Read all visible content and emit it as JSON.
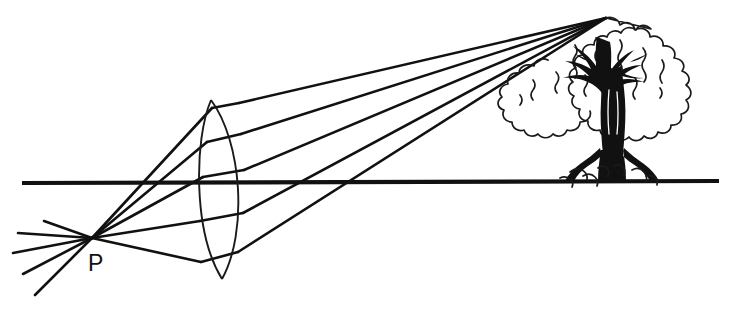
{
  "figure": {
    "background_color": "#ffffff",
    "ink_color": "#111111",
    "width": 731,
    "height": 310
  },
  "labels": {
    "point_p": "P"
  },
  "optical_axis": {
    "name": "optical-axis",
    "x_start": 22,
    "y_start": 183,
    "x_end": 719,
    "y_end": 181,
    "stroke_width": 4.2
  },
  "lens": {
    "name": "biconvex-converging-lens",
    "type": "biconvex",
    "top_tip_x": 211,
    "top_tip_y": 100,
    "bottom_tip_x": 222,
    "bottom_tip_y": 279,
    "left_bulge_x": 196,
    "right_bulge_x": 246,
    "center_x": 221,
    "center_y": 190
  },
  "object_point": {
    "name": "point-p",
    "label": "P",
    "x": 92,
    "y": 238,
    "label_x": 88,
    "label_y": 270
  },
  "image_point": {
    "name": "tree-top-convergence-point",
    "x": 606,
    "y": 18
  },
  "rays": {
    "count_through_lens": 5,
    "count_diverging_left": 5,
    "incoming_from_p": [
      {
        "name": "ray-1",
        "lens_y": 106
      },
      {
        "name": "ray-2",
        "lens_y": 140
      },
      {
        "name": "ray-3",
        "lens_y": 176
      },
      {
        "name": "ray-4",
        "lens_y": 221
      },
      {
        "name": "ray-5",
        "lens_y": 263
      }
    ],
    "diverging_left_of_p": [
      {
        "name": "diverging-ray-1",
        "end_x": 46,
        "end_y": 222
      },
      {
        "name": "diverging-ray-2",
        "end_x": 20,
        "end_y": 234
      },
      {
        "name": "diverging-ray-3",
        "end_x": 14,
        "end_y": 253
      },
      {
        "name": "diverging-ray-4",
        "end_x": 24,
        "end_y": 274
      },
      {
        "name": "diverging-ray-5",
        "end_x": 36,
        "end_y": 294
      }
    ]
  },
  "tree": {
    "name": "tree-object",
    "crown_left_x": 508,
    "crown_right_x": 687,
    "crown_top_y": 16,
    "crown_bottom_y": 118,
    "trunk_base_x": 612,
    "trunk_base_y": 182,
    "ground_y": 182,
    "description": "Deciduous tree with scalloped cloud-like foliage crown, dark branching trunk and exposed roots resting on the ground line"
  }
}
